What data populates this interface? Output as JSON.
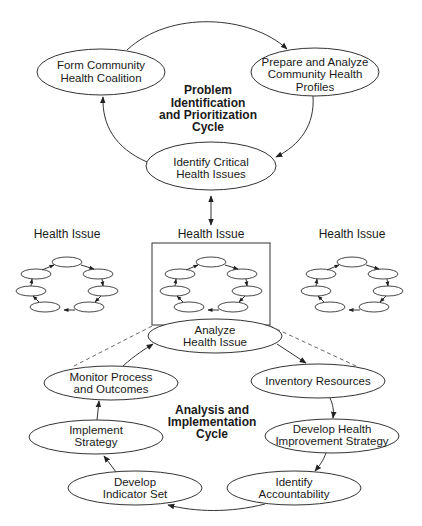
{
  "colors": {
    "line": "#333333",
    "text": "#1a1a1a",
    "background": "#ffffff"
  },
  "top_cycle": {
    "label_lines": [
      "Problem",
      "Identification",
      "and Prioritization",
      "Cycle"
    ],
    "nodes": [
      {
        "id": "form-coalition",
        "lines": [
          "Form Community",
          "Health Coalition"
        ]
      },
      {
        "id": "prepare-profiles",
        "lines": [
          "Prepare and Analyze",
          "Community Health",
          "Profiles"
        ]
      },
      {
        "id": "identify-issues",
        "lines": [
          "Identify Critical",
          "Health Issues"
        ]
      }
    ]
  },
  "health_issues": [
    {
      "label": "Health Issue"
    },
    {
      "label": "Health Issue"
    },
    {
      "label": "Health Issue"
    }
  ],
  "bottom_cycle": {
    "label_lines": [
      "Analysis and",
      "Implementation",
      "Cycle"
    ],
    "nodes": [
      {
        "id": "analyze-issue",
        "lines": [
          "Analyze",
          "Health Issue"
        ]
      },
      {
        "id": "inventory-resources",
        "lines": [
          "Inventory Resources"
        ]
      },
      {
        "id": "develop-strategy",
        "lines": [
          "Develop Health",
          "Improvement Strategy"
        ]
      },
      {
        "id": "identify-accountability",
        "lines": [
          "Identify",
          "Accountability"
        ]
      },
      {
        "id": "develop-indicators",
        "lines": [
          "Develop",
          "Indicator Set"
        ]
      },
      {
        "id": "implement-strategy",
        "lines": [
          "Implement",
          "Strategy"
        ]
      },
      {
        "id": "monitor-outcomes",
        "lines": [
          "Monitor Process",
          "and Outcomes"
        ]
      }
    ]
  }
}
